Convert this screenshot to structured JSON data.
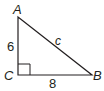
{
  "diagram": {
    "type": "right-triangle",
    "vertices": {
      "A": {
        "label": "A"
      },
      "B": {
        "label": "B"
      },
      "C": {
        "label": "C"
      }
    },
    "sides": {
      "AC": {
        "label": "6"
      },
      "CB": {
        "label": "8"
      },
      "AB": {
        "label": "c"
      }
    },
    "right_angle_at": "C",
    "stroke_color": "#231f20"
  }
}
